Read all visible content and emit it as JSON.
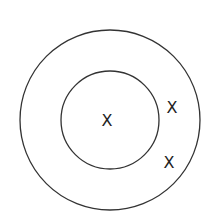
{
  "diagram": {
    "stroke_color": "#333333",
    "marks": [
      {
        "label": "X",
        "region": "inner-circle-center"
      },
      {
        "label": "X",
        "region": "ring-upper-right"
      },
      {
        "label": "X",
        "region": "ring-lower-right"
      }
    ]
  }
}
